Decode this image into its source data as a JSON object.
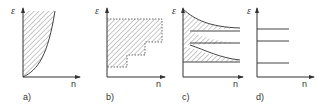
{
  "figure": {
    "axis_labels": {
      "y": "ε",
      "x": "n"
    },
    "panels": [
      {
        "id": "a",
        "label": "a)",
        "description": "Hatched region above a convex rising curve (continuous allowed band)"
      },
      {
        "id": "b",
        "label": "b)",
        "description": "Hatched staircase region bounded by dashed steps"
      },
      {
        "id": "c",
        "label": "c)",
        "description": "Three hatched bands narrowing and converging to horizontal levels"
      },
      {
        "id": "d",
        "label": "d)",
        "description": "Three discrete horizontal levels, no hatching"
      }
    ],
    "colors": {
      "line": "#444444",
      "hatch": "#888888",
      "background": "#ffffff"
    }
  }
}
